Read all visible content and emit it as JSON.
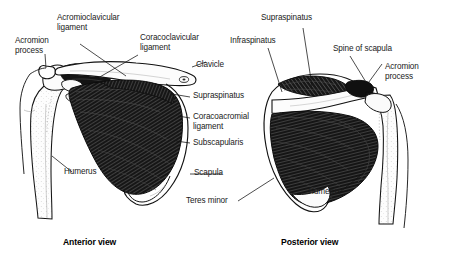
{
  "figure": {
    "background_color": "#ffffff",
    "ink_color": "#111111",
    "muscle_fill": "#1c1c1c",
    "bone_fill": "#fcfcfc"
  },
  "labels": {
    "acromion_process_left": "Acromion\nprocess",
    "acromioclavicular_ligament": "Acromioclavicular\nligament",
    "coracoclavicular_ligament": "Coracoclavicular\nligament",
    "clavicle": "Clavicle",
    "supraspinatus_anterior": "Supraspinatus",
    "coracoacromial_ligament": "Coracoacromial\nligament",
    "subscapularis": "Subscapularis",
    "scapula": "Scapula",
    "teres_minor": "Teres minor",
    "humerus_anterior": "Humerus",
    "supraspinatus_posterior": "Supraspinatus",
    "infraspinatus": "Infraspinatus",
    "spine_of_scapula": "Spine of scapula",
    "acromion_process_right": "Acromion\nprocess",
    "humerus_posterior": "Humerus"
  },
  "captions": {
    "anterior": "Anterior view",
    "posterior": "Posterior view"
  }
}
